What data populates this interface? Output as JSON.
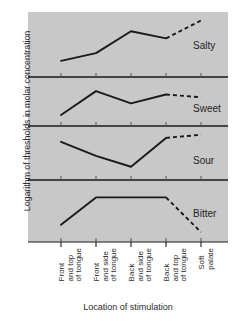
{
  "chart_data": {
    "type": "line",
    "title": "",
    "xlabel": "Location of stimulation",
    "ylabel": "Logarithm of thresholds in molar concentration",
    "grid": false,
    "legend_position": "right-inline-panel-labels",
    "layout": "four stacked panels sharing one x axis",
    "axis_note": "y axis has no numeric tick labels; each panel is an independent log-threshold trace",
    "categories": [
      "Front and top of tongue",
      "Front and side of tongue",
      "Back and side of tongue",
      "Back and top of tongue",
      "Soft palate"
    ],
    "category_lines": [
      [
        "Front",
        "and top",
        "of tongue"
      ],
      [
        "Front",
        "and side",
        "of tongue"
      ],
      [
        "Back",
        "and side",
        "of tongue"
      ],
      [
        "Back",
        "and top",
        "of tongue"
      ],
      [
        "Soft",
        "palate"
      ]
    ],
    "series": [
      {
        "name": "Salty",
        "panel": 1,
        "values": [
          0.18,
          0.33,
          0.76,
          0.62,
          0.97
        ],
        "solid_through_index": 3,
        "dashed_from_index": 3,
        "trend": "rises steadily from front of tongue, peaks at back and side, dips slightly then rises to soft palate"
      },
      {
        "name": "Sweet",
        "panel": 2,
        "values": [
          0.12,
          0.82,
          0.46,
          0.72,
          0.64
        ],
        "solid_through_index": 3,
        "dashed_from_index": 3,
        "trend": "sharp peak at front and side of tongue, dips at back and side, recovers then slightly declines to soft palate"
      },
      {
        "name": "Sour",
        "panel": 3,
        "values": [
          0.8,
          0.44,
          0.16,
          0.9,
          0.98
        ],
        "solid_through_index": 3,
        "dashed_from_index": 3,
        "trend": "declines to minimum at back and side of tongue, then rises sharply to back and top and on to soft palate"
      },
      {
        "name": "Bitter",
        "panel": 4,
        "values": [
          0.22,
          0.8,
          0.8,
          0.8,
          0.06
        ],
        "solid_through_index": 3,
        "dashed_from_index": 3,
        "trend": "rises to a plateau across the tongue then falls steeply to soft palate"
      }
    ],
    "colors": {
      "plot_background": "#c8c8c8",
      "line": "#1a1a1a",
      "text": "#2b2b2b",
      "divider": "#1a1a1a"
    }
  }
}
